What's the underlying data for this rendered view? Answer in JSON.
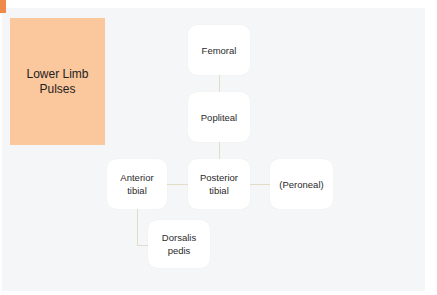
{
  "title": {
    "line1": "Lower Limb",
    "line2": "Pulses"
  },
  "nodes": {
    "femoral": {
      "line1": "Femoral",
      "line2": ""
    },
    "popliteal": {
      "line1": "Popliteal",
      "line2": ""
    },
    "anterior_tibial": {
      "line1": "Anterior",
      "line2": "tibial"
    },
    "posterior_tibial": {
      "line1": "Posterior",
      "line2": "tibial"
    },
    "peroneal": {
      "line1": "(Peroneal)",
      "line2": ""
    },
    "dorsalis_pedis": {
      "line1": "Dorsalis",
      "line2": "pedis"
    }
  },
  "colors": {
    "accent": "#f08a4b",
    "title_block": "#fbc79c",
    "panel": "#f4f6f8",
    "node": "#ffffff",
    "connector": "#e3ddc8"
  }
}
